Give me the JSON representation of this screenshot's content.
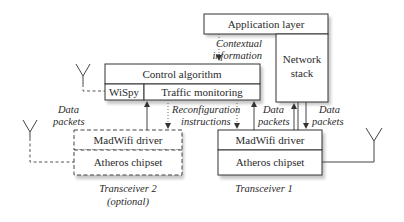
{
  "diagram": {
    "application_layer": "Application layer",
    "network_stack": [
      "Network",
      "stack"
    ],
    "control_algorithm": "Control algorithm",
    "wispy": "WiSpy",
    "traffic_monitoring": "Traffic monitoring",
    "contextual_information": [
      "Contextual",
      "information"
    ],
    "data_packets": [
      "Data",
      "packets"
    ],
    "reconfiguration_instructions": [
      "Reconfiguration",
      "instructions"
    ],
    "transceiver2": {
      "driver": "MadWifi driver",
      "chipset": "Atheros chipset",
      "caption": [
        "Transceiver 2",
        "(optional)"
      ]
    },
    "transceiver1": {
      "driver": "MadWifi driver",
      "chipset": "Atheros chipset",
      "caption": [
        "Transceiver 1"
      ]
    }
  }
}
